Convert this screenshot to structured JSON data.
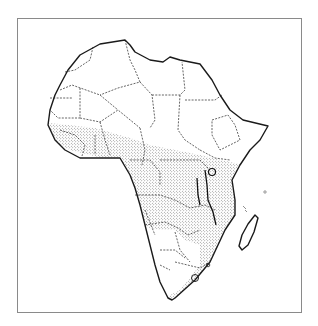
{
  "figure": {
    "shaded_region": "Stippled zone across West, Central, East and Southern Africa",
    "colors": {
      "background": "#ffffff",
      "frame": "#8a8a8a",
      "coastline": "#1a1a1a",
      "borders": "#222222",
      "stipple": "#555555"
    },
    "legend": []
  }
}
